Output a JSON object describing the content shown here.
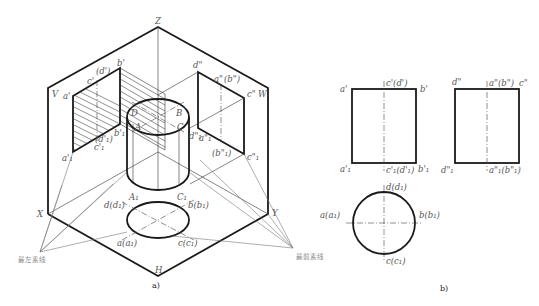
{
  "figure_a": {
    "caption": "a)",
    "planes": {
      "V": "V",
      "W": "W",
      "H": "H"
    },
    "axes": {
      "X": "X",
      "Y": "Y",
      "Z": "Z"
    },
    "cylinder_points": {
      "A": "A",
      "B": "B",
      "C": "C",
      "D": "D",
      "A1": "A₁",
      "C1": "C₁"
    },
    "v_projection_labels": {
      "a_prime": "a'",
      "b_prime": "b'",
      "c_prime": "c'",
      "d_prime": "(d')",
      "a1_prime": "a'₁",
      "b1_prime": "b'₁",
      "c1_prime": "c'₁",
      "d1_prime": "(d'₁)"
    },
    "w_projection_labels": {
      "a_dprime": "a\"",
      "b_dprime": "(b\")",
      "c_dprime": "c\"",
      "d_dprime": "d\"",
      "a1_dprime": "a\"₁",
      "b1_dprime": "(b\"₁)",
      "c1_dprime": "c\"₁",
      "d1_dprime": "d\"₁"
    },
    "h_projection_labels": {
      "a": "a(a₁)",
      "b": "b(b₁)",
      "c": "c(c₁)",
      "d": "d(d₁)"
    },
    "callouts": {
      "leftmost_line": "最左素线",
      "frontmost_line": "最前素线"
    }
  },
  "figure_b": {
    "caption": "b)",
    "front_view": {
      "top_left": "a'",
      "top_mid": "c'(d')",
      "top_right": "b'",
      "bottom_left": "a'₁",
      "bottom_mid": "c'₁(d'₁)",
      "bottom_right": "b'₁"
    },
    "side_view": {
      "top_left": "d\"",
      "top_mid": "a\"(b\")",
      "top_right": "c\"",
      "bottom_left": "d\"₁",
      "bottom_mid": "a\"₁(b\"₁)",
      "bottom_right": "c\"₁"
    },
    "top_view": {
      "top": "d(d₁)",
      "left": "a(a₁)",
      "right": "b(b₁)",
      "bottom": "c(c₁)"
    }
  }
}
